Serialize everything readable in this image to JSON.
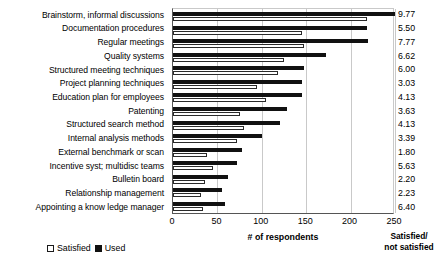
{
  "chart_data": {
    "type": "bar",
    "orientation": "horizontal",
    "title": "",
    "xlabel": "# of respondents",
    "ylabel": "",
    "xlim": [
      0,
      250
    ],
    "xticks": [
      0,
      50,
      100,
      150,
      200,
      250
    ],
    "grid": true,
    "legend_position": "bottom-left",
    "categories": [
      "Brainstorm, informal discussions",
      "Documentation procedures",
      "Regular meetings",
      "Quality systems",
      "Structured meeting techniques",
      "Project planning techniques",
      "Education plan for employees",
      "Patenting",
      "Structured search method",
      "Internal analysis methods",
      "External benchmark or scan",
      "Incentive syst; multidisc teams",
      "Bulletin board",
      "Relationship management",
      "Appointing a know ledge manager"
    ],
    "series": [
      {
        "name": "Used",
        "color": "#111111",
        "values": [
          250,
          218,
          220,
          172,
          147,
          145,
          145,
          128,
          120,
          100,
          78,
          72,
          62,
          55,
          58
        ]
      },
      {
        "name": "Satisfied",
        "color": "#ffffff",
        "values": [
          218,
          145,
          147,
          125,
          118,
          95,
          105,
          76,
          80,
          72,
          38,
          45,
          36,
          32,
          34
        ]
      }
    ],
    "annotation_column": {
      "header": [
        "Satisfied/",
        "not satisfied"
      ],
      "values": [
        "9.77",
        "5.50",
        "7.77",
        "6.62",
        "6.00",
        "3.03",
        "4.13",
        "3.63",
        "4.13",
        "3.39",
        "1.80",
        "5.63",
        "2.20",
        "2.23",
        "6.40"
      ]
    }
  },
  "legend": {
    "items": [
      {
        "label": "Satisfied",
        "swatch": "open-square"
      },
      {
        "label": "Used",
        "swatch": "filled-square"
      }
    ]
  },
  "axis": {
    "x_title": "# of respondents",
    "tick_labels": [
      "0",
      "50",
      "100",
      "150",
      "200",
      "250"
    ]
  },
  "ratio_header_line1": "Satisfied/",
  "ratio_header_line2": "not satisfied"
}
